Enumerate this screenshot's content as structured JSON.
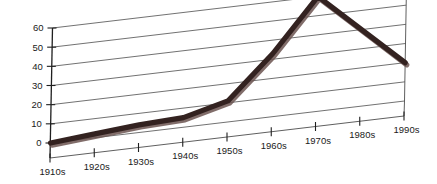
{
  "chart_data": {
    "type": "line",
    "title": "",
    "subtitle": "",
    "xlabel": "",
    "ylabel": "",
    "categories": [
      "1910s",
      "1920s",
      "1930s",
      "1940s",
      "1950s",
      "1960s",
      "1970s",
      "1980s",
      "1990s"
    ],
    "values": [
      0,
      2,
      4,
      5,
      11,
      33,
      60,
      40,
      20
    ],
    "series": [
      {
        "name": "Series 1",
        "values": [
          0,
          2,
          4,
          5,
          11,
          33,
          60,
          40,
          20
        ],
        "color": "#332220"
      }
    ],
    "ylim": [
      0,
      60
    ],
    "ytick_values": [
      0,
      10,
      20,
      30,
      40,
      50,
      60
    ],
    "ytick_labels": [
      "0",
      "10",
      "20",
      "30",
      "40",
      "50",
      "60"
    ],
    "grid": true,
    "grid_axis": "y",
    "legend": false,
    "legend_position": "none",
    "projection": "3d",
    "annotations": []
  },
  "axes": {
    "y_labels": [
      "60",
      "50",
      "40",
      "30",
      "20",
      "10",
      "0"
    ],
    "x_labels": [
      "1910s",
      "1920s",
      "1930s",
      "1940s",
      "1950s",
      "1960s",
      "1970s",
      "1980s",
      "1990s"
    ]
  },
  "colors": {
    "background": "#ffffff",
    "series": "#332220",
    "grid": "#4d4d4d",
    "axis": "#1f1f1f",
    "text": "#1a1a1a"
  }
}
